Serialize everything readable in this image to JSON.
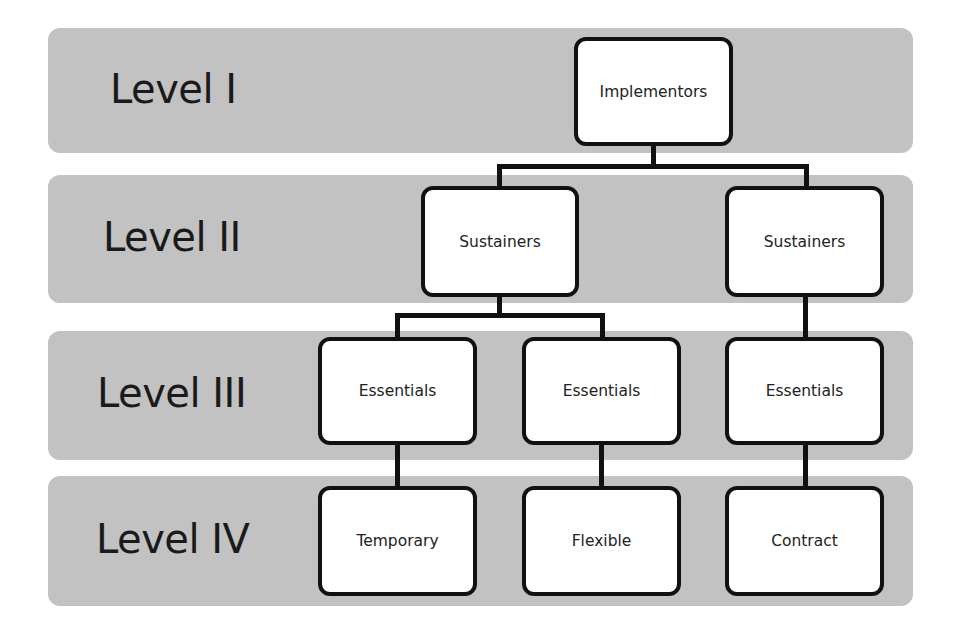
{
  "levels": [
    {
      "label": "Level I"
    },
    {
      "label": "Level II"
    },
    {
      "label": "Level III"
    },
    {
      "label": "Level IV"
    }
  ],
  "nodes": {
    "implementors": "Implementors",
    "sustainers_left": "Sustainers",
    "sustainers_right": "Sustainers",
    "essentials_1": "Essentials",
    "essentials_2": "Essentials",
    "essentials_3": "Essentials",
    "temporary": "Temporary",
    "flexible": "Flexible",
    "contract": "Contract"
  },
  "colors": {
    "band": "#c2c2c2",
    "node_fill": "#ffffff",
    "node_border": "#111111",
    "connector": "#111111"
  }
}
